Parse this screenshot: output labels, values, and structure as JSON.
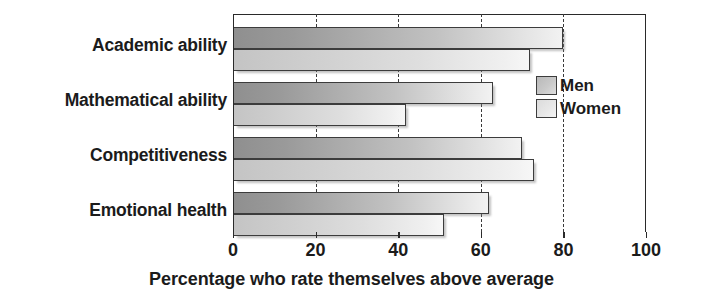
{
  "chart_data": {
    "type": "bar",
    "orientation": "horizontal",
    "title": "",
    "subtitle": "",
    "xlabel": "Percentage who rate themselves above average",
    "ylabel": "",
    "xlim": [
      0,
      100
    ],
    "xticks": [
      0,
      20,
      40,
      60,
      80,
      100
    ],
    "xtick_labels": [
      "0",
      "20",
      "40",
      "60",
      "80",
      "100"
    ],
    "grid": "vertical-dashed",
    "legend_position": "inside-right-upper",
    "categories": [
      "Academic ability",
      "Mathematical ability",
      "Competitiveness",
      "Emotional health"
    ],
    "series": [
      {
        "name": "Men",
        "color": "#b4b4b4",
        "values": [
          80,
          63,
          70,
          62
        ]
      },
      {
        "name": "Women",
        "color": "#dedede",
        "values": [
          72,
          42,
          73,
          51
        ]
      }
    ]
  },
  "labels": {
    "category_0": "Academic ability",
    "category_1": "Mathematical ability",
    "category_2": "Competitiveness",
    "category_3": "Emotional health"
  },
  "ticks": {
    "t0": "0",
    "t1": "20",
    "t2": "40",
    "t3": "60",
    "t4": "80",
    "t5": "100"
  },
  "legend": {
    "men": "Men",
    "women": "Women"
  },
  "axis_title": "Percentage who rate themselves above average"
}
